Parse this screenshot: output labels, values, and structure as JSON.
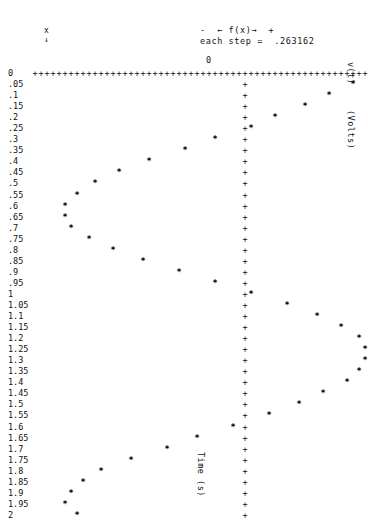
{
  "header": {
    "x_marker": "x",
    "x_arrow": "↓",
    "fx_legend": "-  ← f(x)→  +",
    "step_label": "each step =  .263162",
    "origin_label": "0"
  },
  "axes": {
    "y_axis_title": "v(t)",
    "y_axis_units": "(Volts)",
    "x_axis_title": "Time (s)",
    "x_axis_origin": "0",
    "y_axis_min": "0",
    "y_axis_max": "2",
    "y_axis_step": "0.05",
    "axis_char": "+",
    "point_char": "*",
    "axis_column_index": 35,
    "n_columns": 58,
    "col_width_px": 6.0,
    "grid_left_px": 32,
    "row_height_px": 11.05
  },
  "y_tick_labels": [
    "0",
    ".05",
    ".1",
    ".15",
    ".2",
    ".25",
    ".3",
    ".35",
    ".4",
    ".45",
    ".5",
    ".55",
    ".6",
    ".65",
    ".7",
    ".75",
    ".8",
    ".85",
    ".9",
    ".95",
    "1",
    "1.05",
    "1.1",
    "1.15",
    "1.2",
    "1.25",
    "1.3",
    "1.35",
    "1.4",
    "1.45",
    "1.5",
    "1.55",
    "1.6",
    "1.65",
    "1.7",
    "1.75",
    "1.8",
    "1.85",
    "1.9",
    "1.95",
    "2"
  ],
  "chart_data": {
    "type": "scatter",
    "title": "",
    "xlabel": "Time (s)",
    "ylabel": "v(t) (Volts)",
    "orientation": "vertical-time-axis",
    "step": 0.263162,
    "x": [
      0,
      0.05,
      0.1,
      0.15,
      0.2,
      0.25,
      0.3,
      0.35,
      0.4,
      0.45,
      0.5,
      0.55,
      0.6,
      0.65,
      0.7,
      0.75,
      0.8,
      0.85,
      0.9,
      0.95,
      1.0,
      1.05,
      1.1,
      1.15,
      1.2,
      1.25,
      1.3,
      1.35,
      1.4,
      1.45,
      1.5,
      1.55,
      1.6,
      1.65,
      1.7,
      1.75,
      1.8,
      1.85,
      1.9,
      1.95,
      2.0
    ],
    "xlim": [
      0,
      2
    ],
    "ylim": [
      -9.2105,
      6.0527
    ],
    "grid": false,
    "legend": "none",
    "column_positions": [
      null,
      53,
      49,
      45,
      40,
      36,
      30,
      25,
      19,
      14,
      10,
      7,
      5,
      5,
      6,
      9,
      13,
      18,
      24,
      30,
      36,
      42,
      47,
      51,
      54,
      55,
      55,
      54,
      52,
      48,
      44,
      39,
      33,
      27,
      22,
      16,
      11,
      8,
      6,
      5,
      7
    ],
    "values": [
      0.0,
      4.7369,
      3.6842,
      2.6315,
      1.3157,
      0.2631,
      -1.3157,
      -2.6315,
      -4.2105,
      -5.5263,
      -6.579,
      -7.3684,
      -7.8947,
      -7.8947,
      -7.6316,
      -6.8421,
      -5.7895,
      -4.4737,
      -2.8947,
      -1.3157,
      0.2631,
      1.8421,
      3.1579,
      4.2105,
      5.0,
      5.2632,
      5.2632,
      5.0,
      4.4737,
      3.421,
      2.3684,
      1.0526,
      -0.5263,
      -2.1053,
      -3.421,
      -5.0,
      -6.3158,
      -7.1053,
      -7.6316,
      -7.8947,
      -7.3684
    ],
    "note": "Markers plotted as '*' on a character grid; vertical '+' line is the v=0 axis, horizontal '+' row is the t=0 axis."
  }
}
